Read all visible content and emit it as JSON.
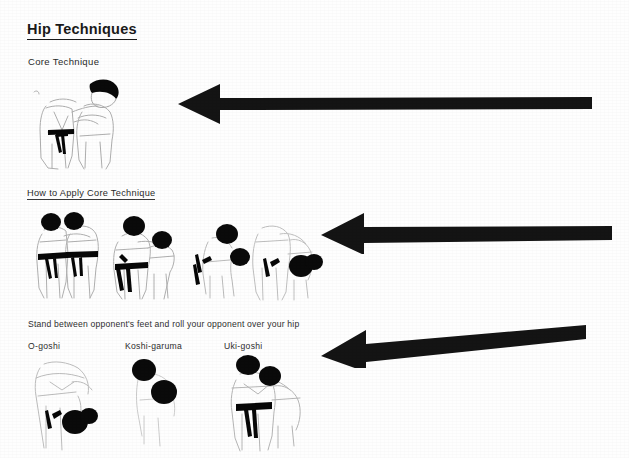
{
  "document": {
    "title": "Hip Techniques",
    "sections": [
      {
        "id": "core-technique",
        "heading": "Core Technique",
        "underlined": false,
        "figure_count": 1
      },
      {
        "id": "how-to-apply",
        "heading": "How to Apply Core Technique",
        "underlined": true,
        "figure_count": 4
      },
      {
        "id": "variations",
        "caption": "Stand between opponent's feet and roll your opponent over your hip",
        "figure_count": 3
      }
    ],
    "throw_names": [
      {
        "label": "O-goshi",
        "x": 28
      },
      {
        "label": "Koshi-garuma",
        "x": 125
      },
      {
        "label": "Uki-goshi",
        "x": 224
      }
    ],
    "annotations": [
      {
        "name": "annotation-arrow-core",
        "direction": "left",
        "tip_x": 178,
        "tail_x": 590,
        "y": 103
      },
      {
        "name": "annotation-arrow-apply",
        "direction": "left",
        "tip_x": 322,
        "tail_x": 611,
        "y": 231
      },
      {
        "name": "annotation-arrow-variations",
        "direction": "left",
        "tip_x": 322,
        "tail_x": 585,
        "y": 341
      }
    ],
    "colors": {
      "ink": "#1a1a1a",
      "arrow": "#151515",
      "paper": "#ffffff",
      "faded_linework": "#9a9a9a"
    },
    "icons": {
      "figure_core": "judo-grip-figure",
      "figure_sequence": "judo-throw-sequence-figure",
      "figure_variation": "judo-hip-throw-figure"
    }
  }
}
